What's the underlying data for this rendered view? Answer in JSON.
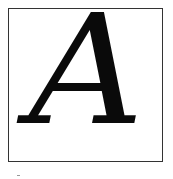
{
  "figure": {
    "letter": "A",
    "letter_color": "#0a0a0a",
    "frame_color": "#333333",
    "background": "#ffffff"
  }
}
